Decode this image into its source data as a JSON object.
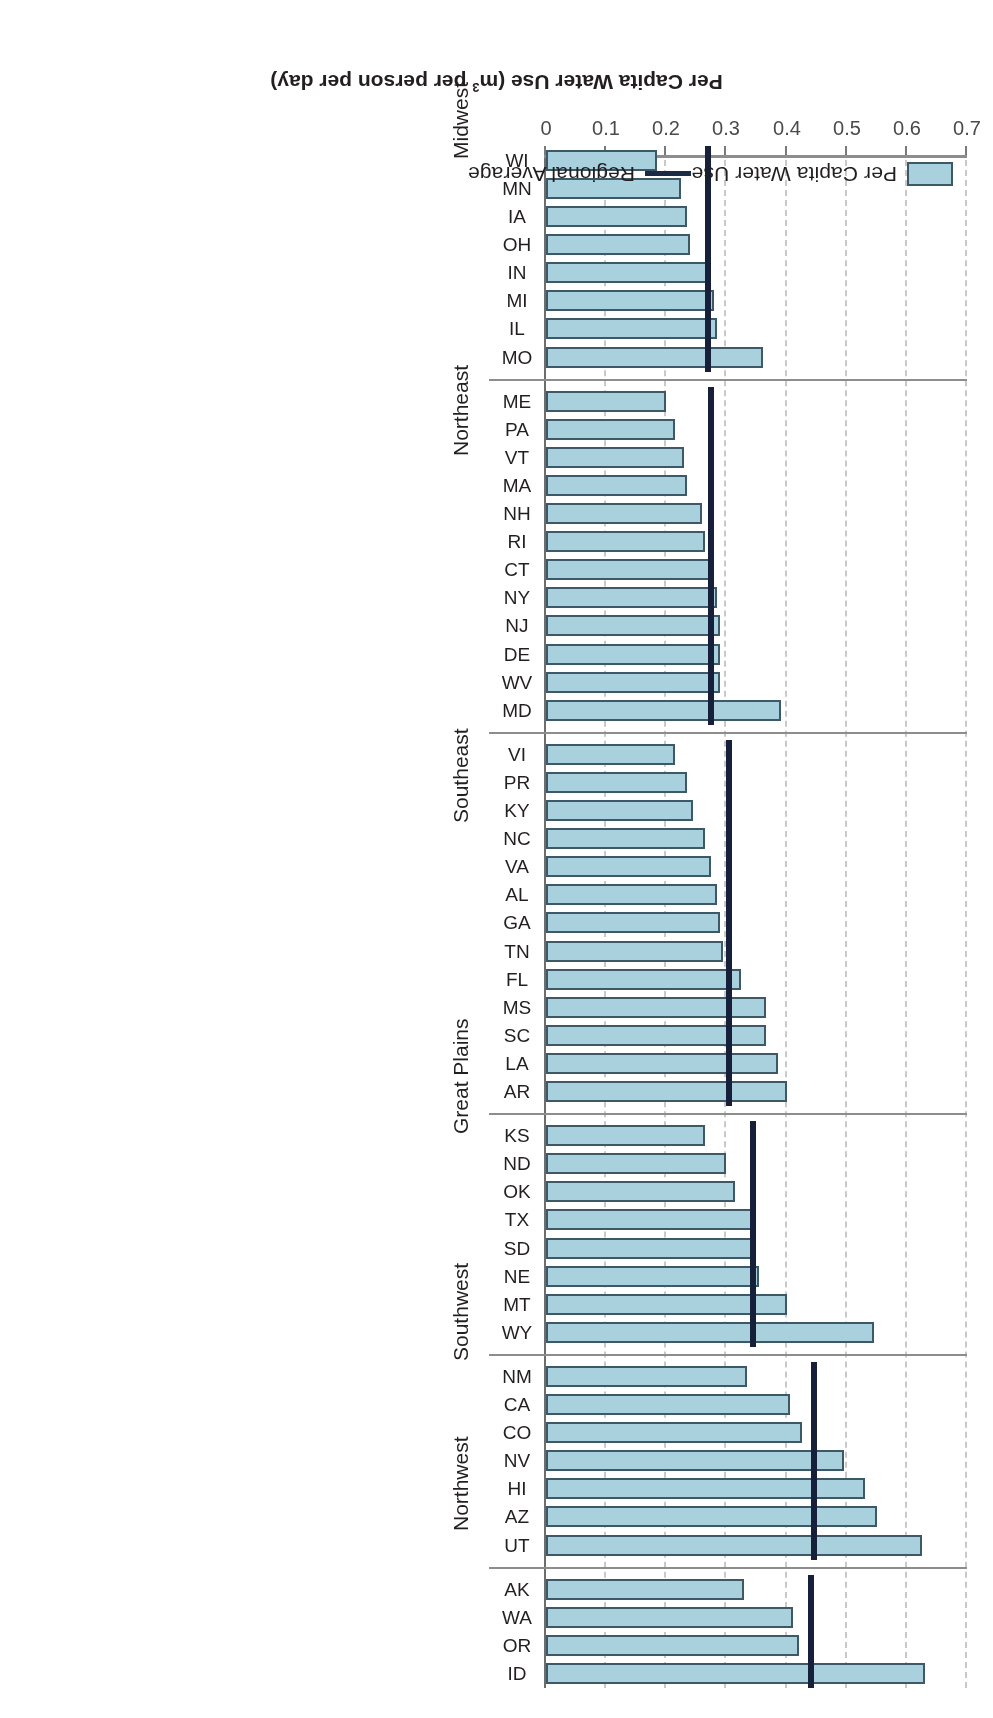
{
  "chart_data": {
    "type": "bar",
    "title": "",
    "orientation": "horizontal",
    "xlabel": "Per Capita Water Use (m3 per person per day)",
    "ylabel": "",
    "xlim": [
      0,
      0.7
    ],
    "xticks": [
      "0",
      "0.1",
      "0.2",
      "0.3",
      "0.4",
      "0.5",
      "0.6",
      "0.7"
    ],
    "grid": "dashed vertical gridlines at 0.1 intervals",
    "legend_position": "bottom",
    "legend": [
      {
        "label": "Per Capita Water Use",
        "type": "bar",
        "color": "#a9d0dd"
      },
      {
        "label": "Regional Average",
        "type": "line",
        "color": "#17203a"
      }
    ],
    "groups": [
      {
        "name": "Northwest",
        "regional_average": 0.44,
        "categories": [
          "ID",
          "OR",
          "WA",
          "AK"
        ],
        "values": [
          0.63,
          0.42,
          0.41,
          0.33
        ]
      },
      {
        "name": "Southwest",
        "regional_average": 0.445,
        "categories": [
          "UT",
          "AZ",
          "HI",
          "NV",
          "CO",
          "CA",
          "NM"
        ],
        "values": [
          0.625,
          0.55,
          0.53,
          0.495,
          0.425,
          0.405,
          0.335
        ]
      },
      {
        "name": "Great Plains",
        "regional_average": 0.345,
        "categories": [
          "WY",
          "MT",
          "NE",
          "SD",
          "TX",
          "OK",
          "ND",
          "KS"
        ],
        "values": [
          0.545,
          0.4,
          0.355,
          0.35,
          0.345,
          0.315,
          0.3,
          0.265
        ]
      },
      {
        "name": "Southeast",
        "regional_average": 0.305,
        "categories": [
          "AR",
          "LA",
          "SC",
          "MS",
          "FL",
          "TN",
          "GA",
          "AL",
          "VA",
          "NC",
          "KY",
          "PR",
          "VI"
        ],
        "values": [
          0.4,
          0.385,
          0.365,
          0.365,
          0.325,
          0.295,
          0.29,
          0.285,
          0.275,
          0.265,
          0.245,
          0.235,
          0.215
        ]
      },
      {
        "name": "Northeast",
        "regional_average": 0.275,
        "categories": [
          "MD",
          "WV",
          "DE",
          "NJ",
          "NY",
          "CT",
          "RI",
          "NH",
          "MA",
          "VT",
          "PA",
          "ME"
        ],
        "values": [
          0.39,
          0.29,
          0.29,
          0.29,
          0.285,
          0.275,
          0.265,
          0.26,
          0.235,
          0.23,
          0.215,
          0.2
        ]
      },
      {
        "name": "Midwest",
        "regional_average": 0.27,
        "categories": [
          "MO",
          "IL",
          "MI",
          "IN",
          "OH",
          "IA",
          "MN",
          "WI"
        ],
        "values": [
          0.36,
          0.285,
          0.28,
          0.275,
          0.24,
          0.235,
          0.225,
          0.185
        ]
      }
    ]
  }
}
